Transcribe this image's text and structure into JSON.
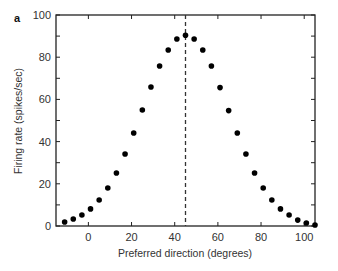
{
  "panel_label": "a",
  "chart_data": {
    "type": "scatter",
    "title": "",
    "xlabel": "Preferred direction (degrees)",
    "ylabel": "Firing rate (spikes/sec)",
    "xlim": [
      -15,
      105
    ],
    "ylim": [
      0,
      100
    ],
    "xticks": [
      0,
      20,
      40,
      60,
      80,
      100
    ],
    "yticks": [
      0,
      20,
      40,
      60,
      80,
      100
    ],
    "y_minor_ticks": [
      10,
      30,
      50,
      70,
      90
    ],
    "grid": false,
    "legend": null,
    "reference_line": {
      "type": "vertical",
      "style": "dashed",
      "x": 45
    },
    "series": [
      {
        "name": "Firing rate",
        "marker": "filled-circle",
        "color": "#000000",
        "x": [
          -11,
          -7,
          -3,
          1,
          5,
          9,
          13,
          17,
          21,
          25,
          29,
          33,
          37,
          41,
          45,
          49,
          53,
          57,
          61,
          65,
          69,
          73,
          77,
          81,
          85,
          89,
          93,
          97,
          101,
          105
        ],
        "y": [
          1.9,
          3.3,
          5.2,
          8.1,
          12.3,
          18.0,
          25.1,
          34.1,
          44.1,
          55.0,
          65.9,
          75.8,
          83.4,
          88.6,
          90.4,
          88.6,
          83.4,
          75.8,
          65.6,
          54.7,
          44.1,
          34.1,
          25.1,
          18.0,
          12.3,
          8.1,
          5.2,
          2.8,
          1.4,
          0.5
        ]
      }
    ]
  },
  "colors": {
    "axis": "#222222",
    "marker": "#000000",
    "dashed_line": "#333333"
  }
}
